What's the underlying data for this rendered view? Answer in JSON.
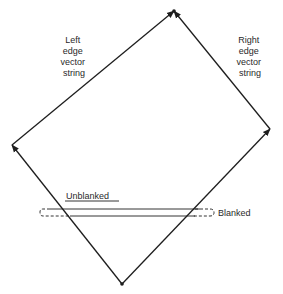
{
  "diagram": {
    "labels": {
      "left_edge": [
        "Left",
        "edge",
        "vector",
        "string"
      ],
      "right_edge": [
        "Right",
        "edge",
        "vector",
        "string"
      ],
      "unblanked": "Unblanked",
      "blanked": "Blanked"
    },
    "vertices": {
      "top": [
        174,
        11
      ],
      "right": [
        270,
        129
      ],
      "bottom": [
        122,
        284
      ],
      "left": [
        12,
        145
      ]
    },
    "colors": {
      "stroke": "#1e1e1e",
      "background": "#ffffff"
    }
  }
}
